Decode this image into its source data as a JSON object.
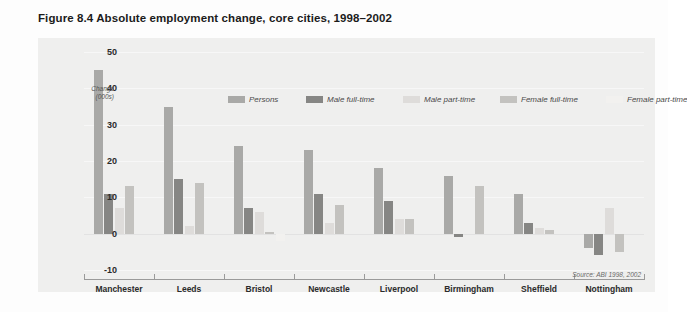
{
  "figure": {
    "title": "Figure 8.4  Absolute employment change, core cities, 1998–2002",
    "source": "Source: ABI 1998, 2002"
  },
  "axis": {
    "y_title_line1": "Change",
    "y_title_line2": "(000s)",
    "y_ticks": [
      "50",
      "40",
      "30",
      "20",
      "10",
      "0",
      "-10"
    ]
  },
  "legend": {
    "items": [
      {
        "label": "Persons",
        "color": "#a9a9a7"
      },
      {
        "label": "Male full-time",
        "color": "#868684"
      },
      {
        "label": "Male part-time",
        "color": "#dedcda"
      },
      {
        "label": "Female full-time",
        "color": "#c3c2bf"
      },
      {
        "label": "Female part-time",
        "color": "#f2f1ef"
      }
    ]
  },
  "colors": {
    "panel_background": "#efefee",
    "page_background": "#fdfdfd",
    "axis_line": "#9a9a9a",
    "gridline": "#f7f7f7",
    "zero_line": "#e2e2e2",
    "title_text": "#1b1b1b",
    "tick_text": "#2b2b2b"
  },
  "chart_data": {
    "type": "bar",
    "title": "Figure 8.4  Absolute employment change, core cities, 1998–2002",
    "xlabel": "",
    "ylabel": "Change (000s)",
    "ylim": [
      -10,
      50
    ],
    "ytick_values": [
      50,
      40,
      30,
      20,
      10,
      0,
      -10
    ],
    "grid": true,
    "legend_position": "top",
    "categories": [
      "Manchester",
      "Leeds",
      "Bristol",
      "Newcastle",
      "Liverpool",
      "Birmingham",
      "Sheffield",
      "Nottingham"
    ],
    "series": [
      {
        "name": "Persons",
        "color": "#a9a9a7",
        "values": [
          45,
          35,
          24,
          23,
          18,
          16,
          11,
          -4
        ]
      },
      {
        "name": "Male full-time",
        "color": "#868684",
        "values": [
          11,
          15,
          7,
          11,
          9,
          -1,
          3,
          -6
        ]
      },
      {
        "name": "Male part-time",
        "color": "#dedcda",
        "values": [
          7,
          2,
          6,
          3,
          4,
          0,
          1.5,
          7
        ]
      },
      {
        "name": "Female full-time",
        "color": "#c3c2bf",
        "values": [
          13,
          14,
          0.5,
          8,
          4,
          13,
          1,
          -5
        ]
      },
      {
        "name": "Female part-time",
        "color": "#f2f1ef",
        "values": [
          0,
          0,
          -2,
          0,
          0,
          0,
          0,
          0
        ]
      }
    ]
  }
}
